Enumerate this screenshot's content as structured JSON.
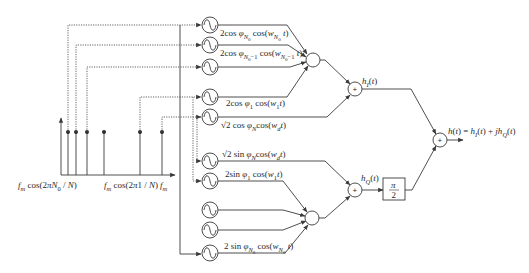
{
  "diagram": {
    "kind": "block diagram: sum-of-sinusoids complex channel gain generator",
    "spectrum": {
      "label_left": [
        {
          "t": "f",
          "s": 0,
          "i": 1
        },
        {
          "t": "m",
          "s": 1,
          "i": 1
        },
        {
          "t": " cos(2",
          "s": 0
        },
        {
          "t": "π",
          "s": 0,
          "i": 1
        },
        {
          "t": "N",
          "s": 0,
          "i": 1
        },
        {
          "t": "0",
          "s": 1
        },
        {
          "t": " / ",
          "s": 0
        },
        {
          "t": "N",
          "s": 0,
          "i": 1
        },
        {
          "t": ")",
          "s": 0
        }
      ],
      "label_left_text": "f_m cos(2πN_0 / N)",
      "label_mid": [
        {
          "t": "f",
          "s": 0,
          "i": 1
        },
        {
          "t": "m",
          "s": 1,
          "i": 1
        },
        {
          "t": " cos(2",
          "s": 0
        },
        {
          "t": "π",
          "s": 0,
          "i": 1
        },
        {
          "t": "1 / ",
          "s": 0
        },
        {
          "t": "N",
          "s": 0,
          "i": 1
        },
        {
          "t": ")",
          "s": 0
        }
      ],
      "label_mid_text": "f_m cos(2π1 / N)",
      "label_right": [
        {
          "t": "f",
          "s": 0,
          "i": 1
        },
        {
          "t": "m",
          "s": 1,
          "i": 1
        }
      ],
      "label_right_text": "f_m",
      "stems_x": [
        68,
        76,
        87,
        104,
        140,
        162
      ]
    },
    "in_phase_branch": {
      "oscillators": [
        {
          "name": "osc-n0",
          "label_text": "2cos φ_{N_0} cos(w_{N_0} t)",
          "label": [
            {
              "t": "2cos ",
              "s": 0
            },
            {
              "t": "φ",
              "s": 0,
              "i": 1
            },
            {
              "t": "N",
              "s": 1,
              "i": 1
            },
            {
              "t": "0",
              "s": 2
            },
            {
              "t": " cos(",
              "s": 0
            },
            {
              "t": "w",
              "s": 0,
              "i": 1
            },
            {
              "t": "N",
              "s": 1,
              "i": 1
            },
            {
              "t": "0",
              "s": 2
            },
            {
              "t": " t",
              "s": 0,
              "i": 1
            },
            {
              "t": ")",
              "s": 0
            }
          ]
        },
        {
          "name": "osc-n0-minus-1",
          "label_text": "2cos φ_{N_0-1} cos(w_{N_0-1} t)",
          "label": [
            {
              "t": "2cos ",
              "s": 0
            },
            {
              "t": "φ",
              "s": 0,
              "i": 1
            },
            {
              "t": "N",
              "s": 1,
              "i": 1
            },
            {
              "t": "0",
              "s": 2
            },
            {
              "t": "−1",
              "s": 1
            },
            {
              "t": " cos(",
              "s": 0
            },
            {
              "t": "w",
              "s": 0,
              "i": 1
            },
            {
              "t": "N",
              "s": 1,
              "i": 1
            },
            {
              "t": "0",
              "s": 2
            },
            {
              "t": "−1",
              "s": 1
            },
            {
              "t": " t",
              "s": 0,
              "i": 1
            },
            {
              "t": ")",
              "s": 0
            }
          ]
        },
        {
          "name": "osc-unlabeled-upper",
          "label_text": "",
          "label": []
        },
        {
          "name": "osc-1",
          "label_text": "2cos φ_1 cos(w_1 t)",
          "label": [
            {
              "t": "2cos ",
              "s": 0
            },
            {
              "t": "φ",
              "s": 0,
              "i": 1
            },
            {
              "t": "1",
              "s": 1
            },
            {
              "t": " cos(",
              "s": 0
            },
            {
              "t": "w",
              "s": 0,
              "i": 1
            },
            {
              "t": "1",
              "s": 1
            },
            {
              "t": "t",
              "s": 0,
              "i": 1
            },
            {
              "t": ")",
              "s": 0
            }
          ]
        },
        {
          "name": "osc-doppler-cos",
          "label_text": "√2 cos φ_N cos(w_d t)",
          "label": [
            {
              "t": "√2 cos ",
              "s": 0
            },
            {
              "t": "φ",
              "s": 0,
              "i": 1
            },
            {
              "t": "N",
              "s": 1,
              "i": 1
            },
            {
              "t": "cos(",
              "s": 0
            },
            {
              "t": "w",
              "s": 0,
              "i": 1
            },
            {
              "t": "d",
              "s": 1,
              "i": 1
            },
            {
              "t": "t",
              "s": 0,
              "i": 1
            },
            {
              "t": ")",
              "s": 0
            }
          ]
        }
      ],
      "output_label": [
        {
          "t": "h",
          "s": 0,
          "i": 1
        },
        {
          "t": "I",
          "s": 1,
          "i": 1
        },
        {
          "t": "(",
          "s": 0
        },
        {
          "t": "t",
          "s": 0,
          "i": 1
        },
        {
          "t": ")",
          "s": 0
        }
      ],
      "output_label_text": "h_I(t)"
    },
    "quadrature_branch": {
      "oscillators": [
        {
          "name": "osc-doppler-sin",
          "label_text": "√2 sin φ_N cos(w_d t)",
          "label": [
            {
              "t": "√2 sin ",
              "s": 0
            },
            {
              "t": "φ",
              "s": 0,
              "i": 1
            },
            {
              "t": "N",
              "s": 1,
              "i": 1
            },
            {
              "t": "cos(",
              "s": 0
            },
            {
              "t": "w",
              "s": 0,
              "i": 1
            },
            {
              "t": "d",
              "s": 1,
              "i": 1
            },
            {
              "t": "t",
              "s": 0,
              "i": 1
            },
            {
              "t": ")",
              "s": 0
            }
          ]
        },
        {
          "name": "osc-1-sin",
          "label_text": "2sin φ_1 cos(w_1 t)",
          "label": [
            {
              "t": "2sin ",
              "s": 0
            },
            {
              "t": "φ",
              "s": 0,
              "i": 1
            },
            {
              "t": "1",
              "s": 1
            },
            {
              "t": " cos(",
              "s": 0
            },
            {
              "t": "w",
              "s": 0,
              "i": 1
            },
            {
              "t": "1",
              "s": 1
            },
            {
              "t": "t",
              "s": 0,
              "i": 1
            },
            {
              "t": ")",
              "s": 0
            }
          ]
        },
        {
          "name": "osc-unlabeled-lower-a",
          "label_text": "",
          "label": []
        },
        {
          "name": "osc-unlabeled-lower-b",
          "label_text": "",
          "label": []
        },
        {
          "name": "osc-n0-sin",
          "label_text": "2 sin φ_{N_0} cos(w_{N_0} t)",
          "label": [
            {
              "t": "2 sin ",
              "s": 0
            },
            {
              "t": "φ",
              "s": 0,
              "i": 1
            },
            {
              "t": "N",
              "s": 1,
              "i": 1
            },
            {
              "t": "0",
              "s": 2
            },
            {
              "t": " cos(",
              "s": 0
            },
            {
              "t": "w",
              "s": 0,
              "i": 1
            },
            {
              "t": "N",
              "s": 1,
              "i": 1
            },
            {
              "t": "0",
              "s": 2
            },
            {
              "t": " t",
              "s": 0,
              "i": 1
            },
            {
              "t": ")",
              "s": 0
            }
          ]
        }
      ],
      "output_label": [
        {
          "t": "h",
          "s": 0,
          "i": 1
        },
        {
          "t": "Q",
          "s": 1,
          "i": 1
        },
        {
          "t": "(",
          "s": 0
        },
        {
          "t": "t",
          "s": 0,
          "i": 1
        },
        {
          "t": ")",
          "s": 0
        }
      ],
      "output_label_text": "h_Q(t)"
    },
    "phase_shift_block": {
      "numerator": "π",
      "denominator": "2"
    },
    "adder_symbol": "+",
    "final_output": {
      "label": [
        {
          "t": "h",
          "s": 0,
          "i": 1
        },
        {
          "t": "(",
          "s": 0
        },
        {
          "t": "t",
          "s": 0,
          "i": 1
        },
        {
          "t": ") = ",
          "s": 0
        },
        {
          "t": "h",
          "s": 0,
          "i": 1
        },
        {
          "t": "I",
          "s": 1,
          "i": 1
        },
        {
          "t": "(",
          "s": 0
        },
        {
          "t": "t",
          "s": 0,
          "i": 1
        },
        {
          "t": ") + ",
          "s": 0
        },
        {
          "t": "jh",
          "s": 0,
          "i": 1
        },
        {
          "t": "Q",
          "s": 1,
          "i": 1
        },
        {
          "t": "(",
          "s": 0
        },
        {
          "t": "t",
          "s": 0,
          "i": 1
        },
        {
          "t": ")",
          "s": 0
        }
      ],
      "label_text": "h(t) = h_I(t) + jh_Q(t)"
    },
    "colors": {
      "line": "#3a3a3a",
      "text": "#2a2a2a",
      "background": "#ffffff"
    }
  }
}
